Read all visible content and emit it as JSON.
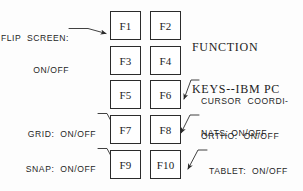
{
  "diagram": {
    "title_line1": "FUNCTION",
    "title_line2": "KEYS--IBM PC",
    "background_color": "#ffffff",
    "stroke_color": "#2b2b2b"
  },
  "keys": [
    {
      "label": "F1",
      "x": 110,
      "y": 11,
      "w": 31,
      "h": 29
    },
    {
      "label": "F2",
      "x": 150,
      "y": 11,
      "w": 31,
      "h": 29
    },
    {
      "label": "F3",
      "x": 110,
      "y": 46,
      "w": 31,
      "h": 29
    },
    {
      "label": "F4",
      "x": 150,
      "y": 46,
      "w": 31,
      "h": 29
    },
    {
      "label": "F5",
      "x": 110,
      "y": 80,
      "w": 31,
      "h": 29
    },
    {
      "label": "F6",
      "x": 150,
      "y": 80,
      "w": 31,
      "h": 29
    },
    {
      "label": "F7",
      "x": 110,
      "y": 115,
      "w": 31,
      "h": 29
    },
    {
      "label": "F8",
      "x": 150,
      "y": 115,
      "w": 31,
      "h": 29
    },
    {
      "label": "F9",
      "x": 110,
      "y": 150,
      "w": 31,
      "h": 29
    },
    {
      "label": "F10",
      "x": 150,
      "y": 150,
      "w": 31,
      "h": 29
    }
  ],
  "annotations": [
    {
      "id": "flip-screen",
      "line1": "FLIP  SCREEN:",
      "line2": "ON/OFF",
      "target_key": "F1",
      "side": "left"
    },
    {
      "id": "cursor-coordinates",
      "line1": "CURSOR  COORDI-",
      "line2": "NATS: ON/OFF",
      "target_key": "F6",
      "side": "right"
    },
    {
      "id": "grid",
      "line1": "GRID:  ON/OFF",
      "line2": "",
      "target_key": "F7",
      "side": "left"
    },
    {
      "id": "ortho",
      "line1": "ORTHO:  ON/OFF",
      "line2": "",
      "target_key": "F8",
      "side": "right"
    },
    {
      "id": "snap",
      "line1": "SNAP:  ON/OFF",
      "line2": "",
      "target_key": "F9",
      "side": "left"
    },
    {
      "id": "tablet",
      "line1": "TABLET:  ON/OFF",
      "line2": "",
      "target_key": "F10",
      "side": "right"
    }
  ]
}
